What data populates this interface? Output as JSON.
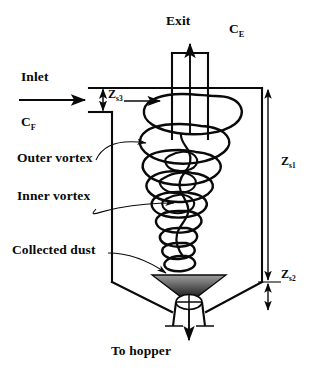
{
  "figure": {
    "background_color": "#ffffff",
    "line_color": "#0a0a0a",
    "dust_fill_dark": "#2b2b2b",
    "dust_fill_light": "#b9b9b9"
  },
  "labels": {
    "exit": "Exit",
    "concentration_exit": "C",
    "concentration_exit_sub": "E",
    "inlet": "Inlet",
    "concentration_feed": "C",
    "concentration_feed_sub": "F",
    "z_s3": "Z",
    "z_s3_sub": "s3",
    "z_s1": "Z",
    "z_s1_sub": "s1",
    "z_s2": "Z",
    "z_s2_sub": "s2",
    "outer_vortex": "Outer vortex",
    "inner_vortex": "Inner vortex",
    "collected_dust": "Collected dust",
    "to_hopper": "To hopper"
  },
  "geometry": {
    "body_left_x": 112,
    "body_right_x": 262,
    "body_top_y": 88,
    "cylinder_bottom_y": 282,
    "cone_bottom_y": 312,
    "vortex_finder_left_x": 172,
    "vortex_finder_right_x": 208,
    "vortex_finder_top_y": 53,
    "vortex_finder_bottom_y": 139,
    "roof_y": 88,
    "inlet_duct_bottom_y": 112,
    "dim_line_x": 268,
    "dust_bed_top_y": 275,
    "dust_bed_bottom_y": 297
  },
  "annotations": {
    "flow_arrows": [
      "inlet-flow-arrow",
      "exit-flow-arrow",
      "hopper-flow-arrow",
      "inlet-entry-arrow"
    ],
    "dimension_arrows": [
      "z-s3-arrow",
      "z-s1-arrow",
      "z-s2-arrow"
    ],
    "leader_lines": [
      "outer-vortex-leader",
      "inner-vortex-leader",
      "collected-dust-leader"
    ]
  }
}
